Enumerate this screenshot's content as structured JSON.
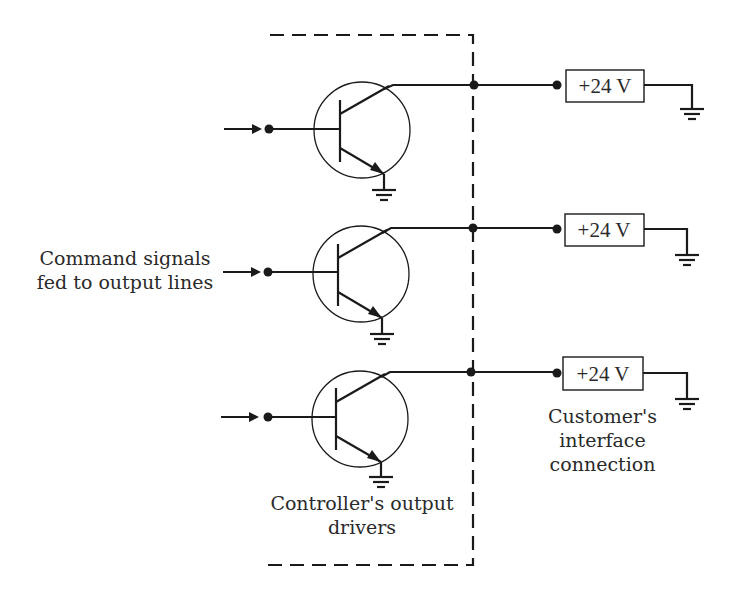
{
  "diagram": {
    "type": "output driver circuit",
    "labels": {
      "command_signals": [
        "Command signals",
        "fed to output lines"
      ],
      "controller_drivers": [
        "Controller's output",
        "drivers"
      ],
      "customer_interface": [
        "Customer's",
        "interface",
        "connection"
      ]
    },
    "channels": [
      {
        "id": 1,
        "supply_label": "+24 V"
      },
      {
        "id": 2,
        "supply_label": "+24 V"
      },
      {
        "id": 3,
        "supply_label": "+24 V"
      }
    ],
    "colors": {
      "ink": "#1a1a1a",
      "background": "#ffffff"
    }
  }
}
